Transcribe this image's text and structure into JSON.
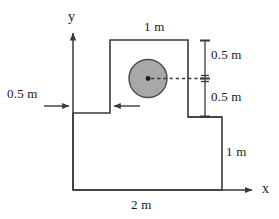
{
  "figure": {
    "axes": {
      "y_axis_label": "y",
      "x_axis_label": "x"
    },
    "dimensions": {
      "top_width": "1 m",
      "right_upper_offset": "0.5 m",
      "right_lower_offset": "0.5 m",
      "left_offset": "0.5 m",
      "right_height": "1 m",
      "bottom_width": "2 m"
    },
    "colors": {
      "stroke": "#3a3a3a",
      "circle_fill": "#a8a8a8",
      "circle_stroke": "#4a4a4a",
      "background": "#ffffff",
      "text": "#1a1a1a"
    },
    "shapes": {
      "outline_name": "stepped-polygon",
      "circle_name": "circular-hole",
      "center_marker": "hole-center-dot",
      "centerline": "hole-centerline-dashed"
    }
  }
}
